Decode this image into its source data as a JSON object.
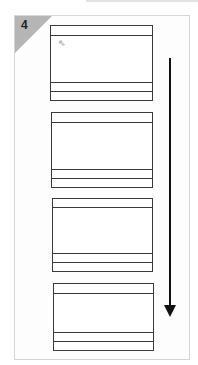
{
  "step": {
    "number": "4"
  },
  "screens": [
    {
      "id": "screen-1",
      "top": 25,
      "height": 76
    },
    {
      "id": "screen-2",
      "top": 112,
      "height": 76
    },
    {
      "id": "screen-3",
      "top": 198,
      "height": 74
    },
    {
      "id": "screen-4",
      "top": 283,
      "height": 68
    }
  ],
  "cursor": {
    "icon": "pointer-cursor-icon",
    "glyph": "⇖"
  },
  "arrow": {
    "direction": "down",
    "icon": "arrow-down-icon"
  },
  "colors": {
    "corner": "#b5b5b5",
    "lines": "#3a3a3a",
    "arrow": "#111111"
  }
}
